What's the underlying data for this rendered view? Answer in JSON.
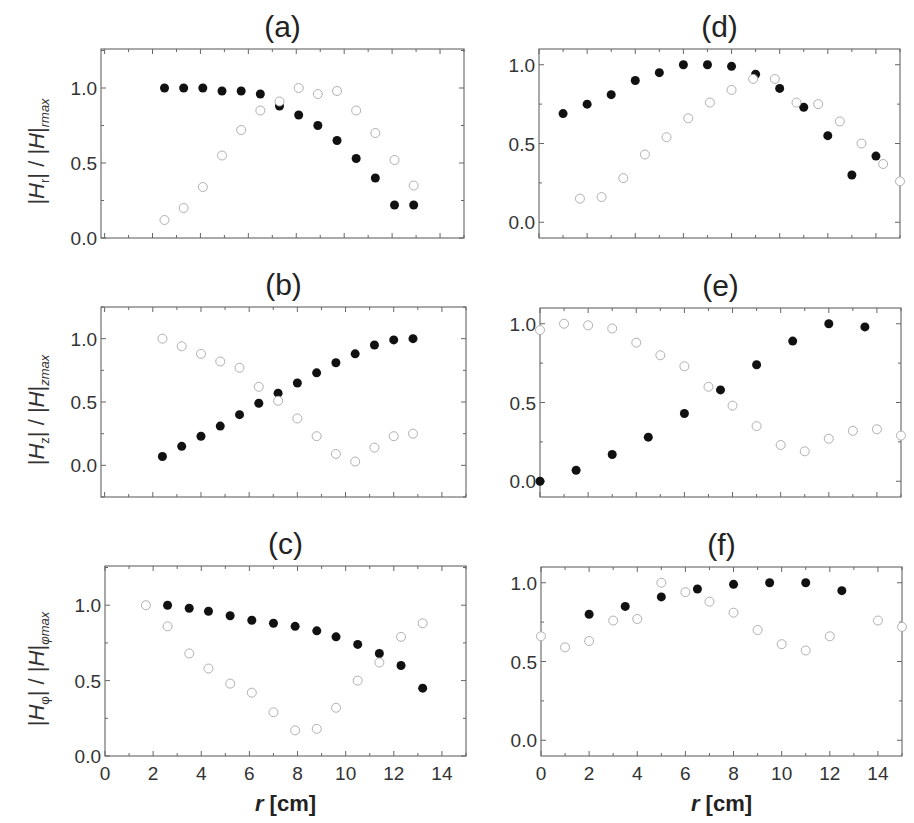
{
  "figure": {
    "xlabel_italic": "r",
    "xlabel_unit": " [cm]"
  },
  "chart_data": [
    {
      "id": "a",
      "type": "scatter",
      "title": "(a)",
      "xlabel": "",
      "ylabel": "|H_r| / |H_r|_max",
      "ylabel_parts": {
        "base": "H",
        "sub": "r"
      },
      "xlim": [
        -0.15,
        15
      ],
      "ylim": [
        0,
        1.26
      ],
      "yticks": [
        0.0,
        0.5,
        1.0
      ],
      "yticklabels": [
        "0.0",
        "0.5",
        "1.0"
      ],
      "xticks": [],
      "xticklabels": [],
      "frame_px": {
        "x0": 101,
        "x1": 464,
        "y0": 49,
        "y1": 238
      },
      "series": [
        {
          "name": "filled",
          "marker": "filled",
          "x": [
            2.5,
            3.3,
            4.1,
            4.9,
            5.7,
            6.5,
            7.3,
            8.1,
            8.9,
            9.7,
            10.5,
            11.3,
            12.1,
            12.9
          ],
          "y": [
            1.0,
            1.0,
            1.0,
            0.98,
            0.98,
            0.96,
            0.88,
            0.82,
            0.75,
            0.65,
            0.53,
            0.4,
            0.22,
            0.22
          ]
        },
        {
          "name": "open",
          "marker": "open",
          "x": [
            2.5,
            3.3,
            4.1,
            4.9,
            5.7,
            6.5,
            7.3,
            8.1,
            8.9,
            9.7,
            10.5,
            11.3,
            12.1,
            12.9
          ],
          "y": [
            0.12,
            0.2,
            0.34,
            0.55,
            0.72,
            0.85,
            0.91,
            1.0,
            0.96,
            0.98,
            0.85,
            0.7,
            0.52,
            0.35
          ]
        }
      ]
    },
    {
      "id": "b",
      "type": "scatter",
      "title": "(b)",
      "xlabel": "",
      "ylabel": "|H_z| / |H_z|_max",
      "ylabel_parts": {
        "base": "H",
        "sub": "z"
      },
      "xlim": [
        -0.15,
        15
      ],
      "ylim": [
        -0.25,
        1.25
      ],
      "yticks": [
        0.0,
        0.5,
        1.0
      ],
      "yticklabels": [
        "0.0",
        "0.5",
        "1.0"
      ],
      "xticks": [],
      "xticklabels": [],
      "frame_px": {
        "x0": 101,
        "x1": 466,
        "y0": 307,
        "y1": 497
      },
      "series": [
        {
          "name": "filled",
          "marker": "filled",
          "x": [
            2.4,
            3.2,
            4.0,
            4.8,
            5.6,
            6.4,
            7.2,
            8.0,
            8.8,
            9.6,
            10.4,
            11.2,
            12.0,
            12.8
          ],
          "y": [
            0.07,
            0.15,
            0.23,
            0.31,
            0.4,
            0.49,
            0.57,
            0.65,
            0.73,
            0.81,
            0.88,
            0.95,
            0.99,
            1.0
          ]
        },
        {
          "name": "open",
          "marker": "open",
          "x": [
            2.4,
            3.2,
            4.0,
            4.8,
            5.6,
            6.4,
            7.2,
            8.0,
            8.8,
            9.6,
            10.4,
            11.2,
            12.0,
            12.8
          ],
          "y": [
            1.0,
            0.94,
            0.88,
            0.82,
            0.77,
            0.62,
            0.51,
            0.37,
            0.23,
            0.09,
            0.03,
            0.14,
            0.23,
            0.25
          ]
        }
      ]
    },
    {
      "id": "c",
      "type": "scatter",
      "title": "(c)",
      "xlabel": "r [cm]",
      "ylabel": "|H_φ| / |H_φ|_max",
      "ylabel_parts": {
        "base": "H",
        "sub": "φ"
      },
      "xlim": [
        0,
        15
      ],
      "ylim": [
        0,
        1.26
      ],
      "yticks": [
        0.0,
        0.5,
        1.0
      ],
      "yticklabels": [
        "0.0",
        "0.5",
        "1.0"
      ],
      "xticks": [
        0,
        2,
        4,
        6,
        8,
        10,
        12,
        14
      ],
      "xticklabels": [
        "0",
        "2",
        "4",
        "6",
        "8",
        "10",
        "12",
        "14"
      ],
      "frame_px": {
        "x0": 105,
        "x1": 466,
        "y0": 566,
        "y1": 756
      },
      "series": [
        {
          "name": "filled",
          "marker": "filled",
          "x": [
            2.6,
            3.5,
            4.3,
            5.2,
            6.1,
            7.0,
            7.9,
            8.8,
            9.6,
            10.5,
            11.4,
            12.3,
            13.2
          ],
          "y": [
            1.0,
            0.98,
            0.96,
            0.93,
            0.9,
            0.88,
            0.86,
            0.83,
            0.79,
            0.74,
            0.68,
            0.6,
            0.45
          ]
        },
        {
          "name": "open",
          "marker": "open",
          "x": [
            1.7,
            2.6,
            3.5,
            4.3,
            5.2,
            6.1,
            7.0,
            7.9,
            8.8,
            9.6,
            10.5,
            11.4,
            12.3,
            13.2
          ],
          "y": [
            1.0,
            0.86,
            0.68,
            0.58,
            0.48,
            0.42,
            0.29,
            0.17,
            0.18,
            0.32,
            0.5,
            0.62,
            0.79,
            0.88
          ]
        }
      ]
    },
    {
      "id": "d",
      "type": "scatter",
      "title": "(d)",
      "xlabel": "",
      "ylabel": "",
      "xlim": [
        0,
        15
      ],
      "ylim": [
        -0.1,
        1.1
      ],
      "yticks": [
        0.0,
        0.5,
        1.0
      ],
      "yticklabels": [
        "0.0",
        "0.5",
        "1.0"
      ],
      "xticks": [],
      "xticklabels": [],
      "frame_px": {
        "x0": 539,
        "x1": 900,
        "y0": 49,
        "y1": 238
      },
      "series": [
        {
          "name": "filled",
          "marker": "filled",
          "x": [
            1.0,
            2.0,
            3.0,
            4.0,
            5.0,
            6.0,
            7.0,
            8.0,
            9.0,
            10.0,
            11.0,
            12.0,
            13.0,
            14.0
          ],
          "y": [
            0.69,
            0.75,
            0.81,
            0.9,
            0.95,
            1.0,
            1.0,
            0.99,
            0.94,
            0.85,
            0.73,
            0.55,
            0.3,
            0.42
          ]
        },
        {
          "name": "open",
          "marker": "open",
          "x": [
            1.7,
            2.6,
            3.5,
            4.4,
            5.3,
            6.2,
            7.1,
            8.0,
            8.9,
            9.8,
            10.7,
            11.6,
            12.5,
            13.4,
            14.3,
            15.0
          ],
          "y": [
            0.15,
            0.16,
            0.28,
            0.43,
            0.54,
            0.66,
            0.76,
            0.84,
            0.91,
            0.91,
            0.76,
            0.75,
            0.64,
            0.5,
            0.37,
            0.26
          ]
        }
      ]
    },
    {
      "id": "e",
      "type": "scatter",
      "title": "(e)",
      "xlabel": "",
      "ylabel": "",
      "xlim": [
        0,
        15
      ],
      "ylim": [
        -0.1,
        1.1
      ],
      "yticks": [
        0.0,
        0.5,
        1.0
      ],
      "yticklabels": [
        "0.0",
        "0.5",
        "1.0"
      ],
      "xticks": [],
      "xticklabels": [],
      "frame_px": {
        "x0": 540,
        "x1": 901,
        "y0": 308,
        "y1": 497
      },
      "series": [
        {
          "name": "filled",
          "marker": "filled",
          "x": [
            0.0,
            1.5,
            3.0,
            4.5,
            6.0,
            7.5,
            9.0,
            10.5,
            12.0,
            13.5
          ],
          "y": [
            0.0,
            0.07,
            0.17,
            0.28,
            0.43,
            0.58,
            0.74,
            0.89,
            1.0,
            0.98
          ]
        },
        {
          "name": "open",
          "marker": "open",
          "x": [
            0.0,
            1.0,
            2.0,
            3.0,
            4.0,
            5.0,
            6.0,
            7.0,
            8.0,
            9.0,
            10.0,
            11.0,
            12.0,
            13.0,
            14.0,
            15.0
          ],
          "y": [
            0.96,
            1.0,
            0.99,
            0.97,
            0.88,
            0.8,
            0.73,
            0.6,
            0.48,
            0.35,
            0.23,
            0.19,
            0.27,
            0.32,
            0.33,
            0.29
          ]
        }
      ]
    },
    {
      "id": "f",
      "type": "scatter",
      "title": "(f)",
      "xlabel": "r [cm]",
      "ylabel": "",
      "xlim": [
        0,
        15
      ],
      "ylim": [
        -0.1,
        1.1
      ],
      "yticks": [
        0.0,
        0.5,
        1.0
      ],
      "yticklabels": [
        "0.0",
        "0.5",
        "1.0"
      ],
      "xticks": [
        0,
        2,
        4,
        6,
        8,
        10,
        12,
        14
      ],
      "xticklabels": [
        "0",
        "2",
        "4",
        "6",
        "8",
        "10",
        "12",
        "14"
      ],
      "frame_px": {
        "x0": 541,
        "x1": 902,
        "y0": 567,
        "y1": 756
      },
      "series": [
        {
          "name": "filled",
          "marker": "filled",
          "x": [
            2.0,
            3.5,
            5.0,
            6.5,
            8.0,
            9.5,
            11.0,
            12.5
          ],
          "y": [
            0.8,
            0.85,
            0.91,
            0.96,
            0.99,
            1.0,
            1.0,
            0.95
          ]
        },
        {
          "name": "open",
          "marker": "open",
          "x": [
            0.0,
            1.0,
            2.0,
            3.0,
            4.0,
            5.0,
            6.0,
            7.0,
            8.0,
            9.0,
            10.0,
            11.0,
            12.0,
            14.0,
            15.0
          ],
          "y": [
            0.66,
            0.59,
            0.63,
            0.76,
            0.77,
            1.0,
            0.94,
            0.88,
            0.81,
            0.7,
            0.61,
            0.57,
            0.66,
            0.76,
            0.72
          ]
        }
      ]
    }
  ]
}
